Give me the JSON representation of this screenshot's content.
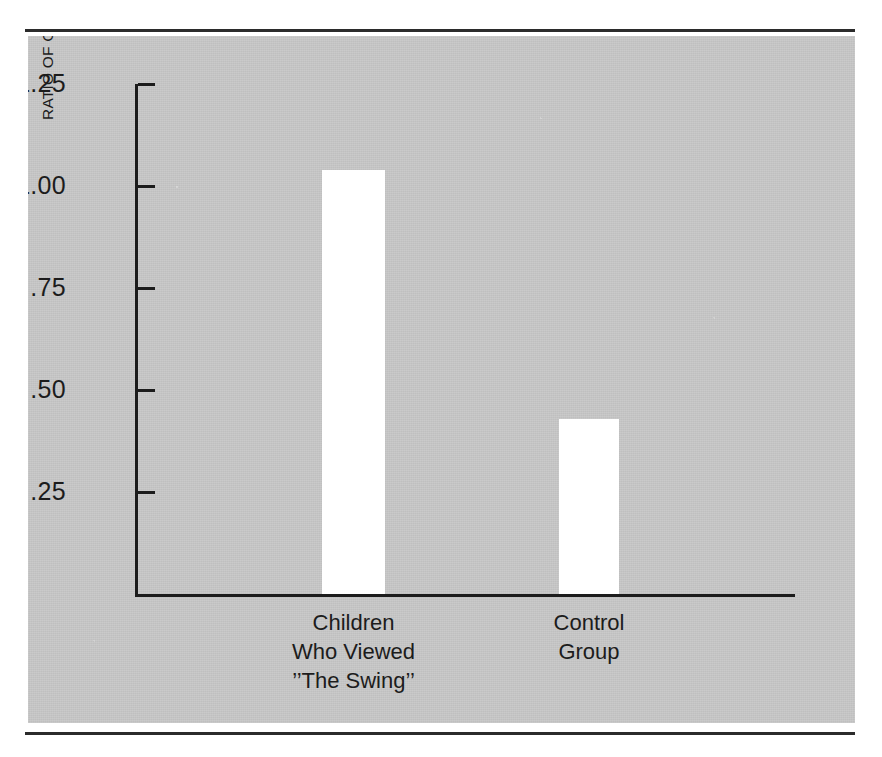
{
  "figure": {
    "background_color": "#ffffff",
    "plate_color": "#c6c6c6",
    "ink_color": "#1c1c1c",
    "bar_color": "#ffffff"
  },
  "chart_data": {
    "type": "bar",
    "title": "",
    "subtitle": "",
    "xlabel": "",
    "ylabel": "RATIO OF COOPERATION TO COMPETITIVENESS",
    "categories": [
      "Children\nWho Viewed\n’’The Swing’’",
      "Control\nGroup"
    ],
    "category_lines": [
      [
        "Children",
        "Who Viewed",
        "’’The Swing’’"
      ],
      [
        "Control",
        "Group"
      ]
    ],
    "values": [
      1.04,
      0.43
    ],
    "ylim": [
      0,
      1.25
    ],
    "yticks": [
      0.25,
      0.5,
      0.75,
      1.0,
      1.25
    ],
    "ytick_labels": [
      ".25",
      ".50",
      ".75",
      "1.00",
      "1.25"
    ],
    "grid": false,
    "legend": false,
    "legend_position": "none",
    "tick_direction": "in",
    "axis_style": "left-and-bottom-spine"
  }
}
